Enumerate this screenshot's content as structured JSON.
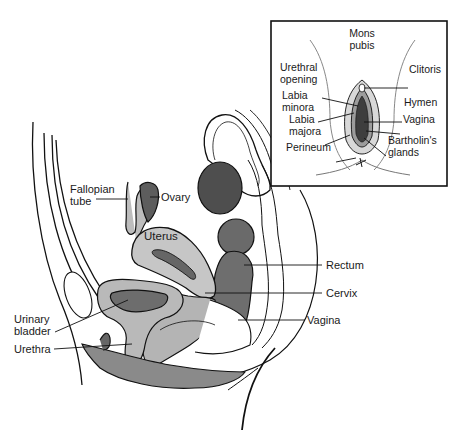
{
  "figure": {
    "main_labels": {
      "fallopian_tube": "Fallopian\ntube",
      "ovary": "Ovary",
      "uterus": "Uterus",
      "rectum": "Rectum",
      "cervix": "Cervix",
      "vagina": "Vagina",
      "urinary_bladder": "Urinary\nbladder",
      "urethra": "Urethra"
    },
    "inset_labels": {
      "mons_pubis": "Mons\npubis",
      "urethral_opening": "Urethral\nopening",
      "clitoris": "Clitoris",
      "labia_minora": "Labia\nminora",
      "hymen": "Hymen",
      "labia_majora": "Labia\nmajora",
      "vagina": "Vagina",
      "bartholins_glands": "Bartholin's\nglands",
      "perineum": "Perineum"
    },
    "colors": {
      "outline": "#111111",
      "light_tissue": "#c4c4c4",
      "mid_tissue": "#8f8f8f",
      "dark_tissue": "#5a5a5a",
      "bowel_dark": "#4a4a4a"
    }
  }
}
